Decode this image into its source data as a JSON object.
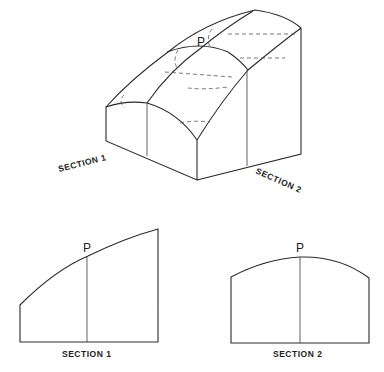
{
  "figure": {
    "isometric": {
      "point_label": "P",
      "section1_label": "SECTION 1",
      "section2_label": "SECTION 2"
    },
    "section1": {
      "point_label": "P",
      "caption": "SECTION 1"
    },
    "section2": {
      "point_label": "P",
      "caption": "SECTION 2"
    }
  }
}
